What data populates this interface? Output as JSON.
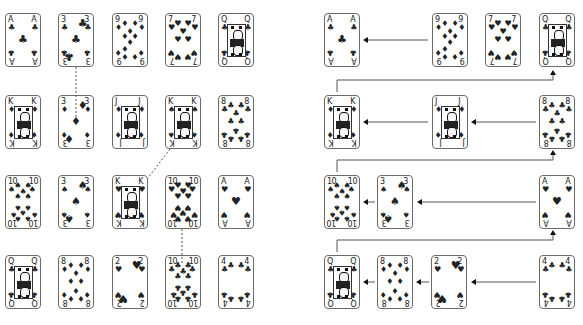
{
  "left_panel": {
    "cards": [
      {
        "id": "L-r0c0",
        "rank": "A",
        "suit": "♣",
        "x": 5,
        "y": 13
      },
      {
        "id": "L-r0c1",
        "rank": "3",
        "suit": "♣",
        "x": 58,
        "y": 13
      },
      {
        "id": "L-r0c2",
        "rank": "9",
        "suit": "♦",
        "x": 112,
        "y": 13
      },
      {
        "id": "L-r0c3",
        "rank": "7",
        "suit": "♥",
        "x": 165,
        "y": 13
      },
      {
        "id": "L-r0c4",
        "rank": "Q",
        "suit": "♣",
        "x": 218,
        "y": 13
      },
      {
        "id": "L-r1c0",
        "rank": "K",
        "suit": "♦",
        "x": 5,
        "y": 95
      },
      {
        "id": "L-r1c1",
        "rank": "3",
        "suit": "♦",
        "x": 58,
        "y": 95
      },
      {
        "id": "L-r1c2",
        "rank": "J",
        "suit": "♦",
        "x": 112,
        "y": 95
      },
      {
        "id": "L-r1c3",
        "rank": "K",
        "suit": "♠",
        "x": 165,
        "y": 95
      },
      {
        "id": "L-r1c4",
        "rank": "8",
        "suit": "♣",
        "x": 218,
        "y": 95
      },
      {
        "id": "L-r2c0",
        "rank": "10",
        "suit": "♠",
        "x": 5,
        "y": 175
      },
      {
        "id": "L-r2c1",
        "rank": "3",
        "suit": "♠",
        "x": 58,
        "y": 175
      },
      {
        "id": "L-r2c2",
        "rank": "K",
        "suit": "♥",
        "x": 112,
        "y": 175
      },
      {
        "id": "L-r2c3",
        "rank": "10",
        "suit": "♥",
        "x": 165,
        "y": 175
      },
      {
        "id": "L-r2c4",
        "rank": "A",
        "suit": "♥",
        "x": 218,
        "y": 175
      },
      {
        "id": "L-r3c0",
        "rank": "Q",
        "suit": "♣",
        "x": 5,
        "y": 255
      },
      {
        "id": "L-r3c1",
        "rank": "8",
        "suit": "♦",
        "x": 58,
        "y": 255
      },
      {
        "id": "L-r3c2",
        "rank": "2",
        "suit": "♥",
        "x": 112,
        "y": 255
      },
      {
        "id": "L-r3c3",
        "rank": "10",
        "suit": "♣",
        "x": 165,
        "y": 255
      },
      {
        "id": "L-r3c4",
        "rank": "4",
        "suit": "♣",
        "x": 218,
        "y": 255
      }
    ],
    "dashed_links": [
      {
        "from": "3♣",
        "to": "3♦",
        "x1": 76,
        "y1": 67,
        "x2": 76,
        "y2": 117
      },
      {
        "from": "K♠",
        "to": "K♥",
        "x1": 170,
        "y1": 149,
        "x2": 148,
        "y2": 178
      },
      {
        "from": "10♥",
        "to": "10♣",
        "x1": 182,
        "y1": 229,
        "x2": 182,
        "y2": 264
      }
    ]
  },
  "right_panel": {
    "cards": [
      {
        "id": "R-r0-a",
        "rank": "A",
        "suit": "♣",
        "x": 324,
        "y": 13
      },
      {
        "id": "R-r0-b",
        "rank": "9",
        "suit": "♦",
        "x": 432,
        "y": 13
      },
      {
        "id": "R-r0-c",
        "rank": "7",
        "suit": "♥",
        "x": 485,
        "y": 13
      },
      {
        "id": "R-r0-d",
        "rank": "Q",
        "suit": "♣",
        "x": 539,
        "y": 13
      },
      {
        "id": "R-r1-a",
        "rank": "K",
        "suit": "♦",
        "x": 324,
        "y": 95
      },
      {
        "id": "R-r1-b",
        "rank": "J",
        "suit": "♦",
        "x": 432,
        "y": 95
      },
      {
        "id": "R-r1-c",
        "rank": "8",
        "suit": "♣",
        "x": 539,
        "y": 95
      },
      {
        "id": "R-r2-a",
        "rank": "10",
        "suit": "♠",
        "x": 324,
        "y": 175
      },
      {
        "id": "R-r2-b",
        "rank": "3",
        "suit": "♠",
        "x": 377,
        "y": 175
      },
      {
        "id": "R-r2-c",
        "rank": "A",
        "suit": "♥",
        "x": 539,
        "y": 175
      },
      {
        "id": "R-r3-a",
        "rank": "Q",
        "suit": "♣",
        "x": 324,
        "y": 255
      },
      {
        "id": "R-r3-b",
        "rank": "8",
        "suit": "♦",
        "x": 377,
        "y": 255
      },
      {
        "id": "R-r3-c",
        "rank": "2",
        "suit": "♥",
        "x": 431,
        "y": 255
      },
      {
        "id": "R-r3-d",
        "rank": "4",
        "suit": "♣",
        "x": 539,
        "y": 255
      }
    ],
    "left_arrows": [
      {
        "x1": 428,
        "x2": 363,
        "y": 40
      },
      {
        "x1": 428,
        "x2": 363,
        "y": 122
      },
      {
        "x1": 536,
        "x2": 471,
        "y": 122
      },
      {
        "x1": 375,
        "x2": 363,
        "y": 202
      },
      {
        "x1": 536,
        "x2": 417,
        "y": 202
      },
      {
        "x1": 375,
        "x2": 363,
        "y": 282
      },
      {
        "x1": 429,
        "x2": 416,
        "y": 282
      },
      {
        "x1": 536,
        "x2": 471,
        "y": 282
      }
    ],
    "wrap_connectors": [
      {
        "y": 80,
        "x_start": 337,
        "x_end": 553,
        "drop_to": 92,
        "arrow_top": 70
      },
      {
        "y": 160,
        "x_start": 337,
        "x_end": 553,
        "drop_to": 172,
        "arrow_top": 150
      },
      {
        "y": 240,
        "x_start": 337,
        "x_end": 553,
        "drop_to": 252,
        "arrow_top": 230
      }
    ]
  },
  "colors": {
    "card_border": "#6a6a6a",
    "ink": "#222222",
    "line": "#555555"
  }
}
